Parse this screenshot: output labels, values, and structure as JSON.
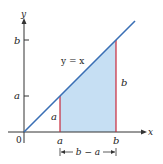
{
  "diagram": {
    "type": "area-under-line",
    "function_label": "y = x",
    "axes": {
      "x_label": "x",
      "y_label": "y",
      "origin_label": "0"
    },
    "x_ticks": [
      {
        "label": "a"
      },
      {
        "label": "b"
      }
    ],
    "y_ticks": [
      {
        "label": "a"
      },
      {
        "label": "b"
      }
    ],
    "segments": [
      {
        "label": "a"
      },
      {
        "label": "b"
      }
    ],
    "width_annotation": "b − a",
    "colors": {
      "line": "#3a6fb5",
      "fill": "#c6dff3",
      "verticals": "#c8283a",
      "axes": "#333333"
    }
  }
}
